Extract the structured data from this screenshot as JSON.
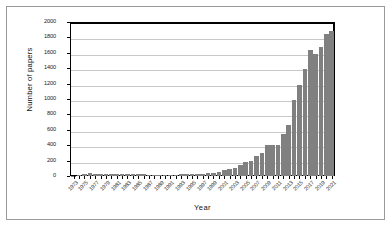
{
  "chart_data": {
    "type": "bar",
    "title": "",
    "xlabel": "Year",
    "ylabel": "Number of papers",
    "ylim": [
      0,
      2000
    ],
    "ytick_step": 200,
    "yticks": [
      2000,
      1800,
      1600,
      1400,
      1200,
      1000,
      800,
      600,
      400,
      200,
      0
    ],
    "grid": "horizontal",
    "legend": "none",
    "bar_color": "#808080",
    "categories": [
      "1973",
      "1974",
      "1975",
      "1976",
      "1977",
      "1978",
      "1979",
      "1980",
      "1981",
      "1982",
      "1983",
      "1984",
      "1985",
      "1986",
      "1987",
      "1988",
      "1989",
      "1990",
      "1991",
      "1992",
      "1993",
      "1994",
      "1995",
      "1996",
      "1997",
      "1998",
      "1999",
      "2000",
      "2001",
      "2002",
      "2003",
      "2004",
      "2005",
      "2006",
      "2007",
      "2008",
      "2009",
      "2010",
      "2011",
      "2012",
      "2013",
      "2014",
      "2015",
      "2016",
      "2017",
      "2018"
    ],
    "tick_labels": [
      "1973",
      "",
      "1975",
      "",
      "1977",
      "",
      "1979",
      "",
      "1981",
      "",
      "1983",
      "",
      "1985",
      "",
      "1987",
      "",
      "1989",
      "",
      "1991",
      "",
      "1993",
      "",
      "1995",
      "",
      "1997",
      "",
      "1999",
      "",
      "2001",
      "",
      "2003",
      "",
      "2005",
      "",
      "2007",
      "",
      "2009",
      "",
      "2011",
      "",
      "2013",
      "",
      "2015",
      "",
      "2017",
      ""
    ],
    "values": [
      5,
      8,
      30,
      35,
      32,
      30,
      28,
      30,
      28,
      26,
      25,
      24,
      22,
      20,
      18,
      16,
      14,
      16,
      15,
      18,
      22,
      25,
      28,
      30,
      32,
      38,
      45,
      55,
      80,
      85,
      110,
      140,
      185,
      200,
      255,
      300,
      400,
      405,
      405,
      545,
      660,
      985,
      1180,
      1385,
      1640,
      1580
    ],
    "values_tail": [
      1680,
      1845,
      1885
    ]
  },
  "axis": {
    "y_title": "Number of papers",
    "x_title": "Year"
  }
}
